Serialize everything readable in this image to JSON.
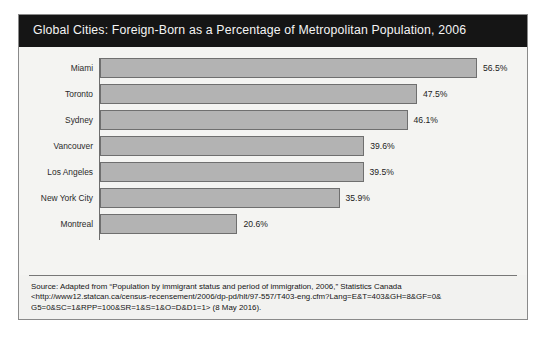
{
  "figure": {
    "title": "Global Cities: Foreign-Born as a Percentage of Metropolitan Population, 2006",
    "header_background": "#151515",
    "header_text_color": "#f4f4f4",
    "panel_background": "#f2f2f0",
    "bar_fill_color": "#b3b3b3",
    "bar_border_color": "#6f6f6f",
    "axis_color": "#6e6e6e"
  },
  "source": {
    "line1": "Source: Adapted from “Population by immigrant status and period of immigration, 2006,” Statistics Canada",
    "line2": "<http://www12.statcan.ca/census-recensement/2006/dp-pd/hlt/97-557/T403-eng.cfm?Lang=E&T=403&GH=8&GF=0&",
    "line3": "G5=0&SC=1&RPP=100&SR=1&S=1&O=D&D1=1> (8 May 2016)."
  },
  "chart_data": {
    "type": "bar",
    "orientation": "horizontal",
    "title": "Global Cities: Foreign-Born as a Percentage of Metropolitan Population, 2006",
    "xlabel": "",
    "ylabel": "",
    "xlim": [
      0,
      56.5
    ],
    "grid": false,
    "legend": false,
    "categories": [
      "Miami",
      "Toronto",
      "Sydney",
      "Vancouver",
      "Los Angeles",
      "New York City",
      "Montreal"
    ],
    "values": [
      56.5,
      47.5,
      46.1,
      39.6,
      39.5,
      35.9,
      20.6
    ],
    "value_labels": [
      "56.5%",
      "47.5%",
      "46.1%",
      "39.6%",
      "39.5%",
      "35.9%",
      "20.6%"
    ],
    "bars": [
      {
        "label": "Miami",
        "value": 56.5,
        "value_label": "56.5%"
      },
      {
        "label": "Toronto",
        "value": 47.5,
        "value_label": "47.5%"
      },
      {
        "label": "Sydney",
        "value": 46.1,
        "value_label": "46.1%"
      },
      {
        "label": "Vancouver",
        "value": 39.6,
        "value_label": "39.6%"
      },
      {
        "label": "Los Angeles",
        "value": 39.5,
        "value_label": "39.5%"
      },
      {
        "label": "New York City",
        "value": 35.9,
        "value_label": "35.9%"
      },
      {
        "label": "Montreal",
        "value": 20.6,
        "value_label": "20.6%"
      }
    ]
  }
}
